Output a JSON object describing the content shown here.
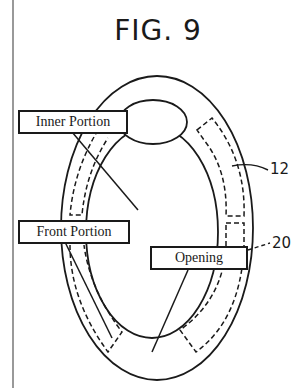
{
  "figure": {
    "title": "FIG. 9",
    "reference_numerals": [
      {
        "id": "12",
        "label": "12"
      },
      {
        "id": "20",
        "label": "20"
      }
    ],
    "labels": [
      {
        "id": "inner-portion",
        "text": "Inner Portion"
      },
      {
        "id": "front-portion",
        "text": "Front Portion"
      },
      {
        "id": "opening",
        "text": "Opening"
      }
    ]
  }
}
